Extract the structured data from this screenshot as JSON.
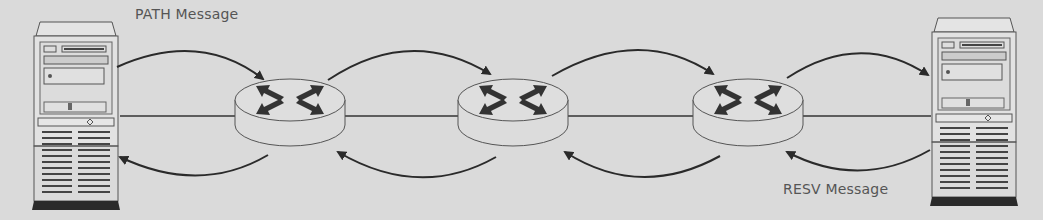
{
  "diagram": {
    "type": "network-signaling",
    "background_color": "#dadada",
    "line_color": "#333333",
    "nodes": [
      {
        "id": "sender-host",
        "kind": "server-tower",
        "position": "left"
      },
      {
        "id": "router-1",
        "kind": "router"
      },
      {
        "id": "router-2",
        "kind": "router"
      },
      {
        "id": "router-3",
        "kind": "router"
      },
      {
        "id": "receiver-host",
        "kind": "server-tower",
        "position": "right"
      }
    ],
    "labels": {
      "path_message": "PATH Message",
      "resv_message": "RESV Message"
    },
    "flows": [
      {
        "name": "PATH",
        "direction": "left-to-right",
        "route": [
          "sender-host",
          "router-1",
          "router-2",
          "router-3",
          "receiver-host"
        ]
      },
      {
        "name": "RESV",
        "direction": "right-to-left",
        "route": [
          "receiver-host",
          "router-3",
          "router-2",
          "router-1",
          "sender-host"
        ]
      }
    ]
  }
}
